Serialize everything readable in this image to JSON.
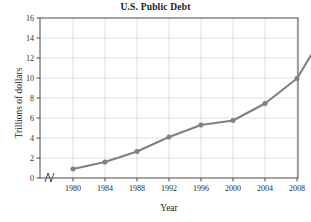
{
  "chart_data": {
    "type": "line",
    "title": "U.S. Public Debt",
    "xlabel": "Year",
    "ylabel": "Trillions of dollars",
    "x": [
      1980,
      1984,
      1988,
      1992,
      1996,
      2000,
      2004,
      2008,
      2012
    ],
    "values": [
      0.9,
      1.6,
      2.65,
      4.1,
      5.3,
      5.75,
      7.45,
      9.95,
      15.25
    ],
    "xtick_labels": [
      "1980",
      "1984",
      "1988",
      "1992",
      "1996",
      "2000",
      "2004",
      "2008",
      "2012"
    ],
    "ytick_labels": [
      "0",
      "2",
      "4",
      "6",
      "8",
      "10",
      "12",
      "14",
      "16"
    ],
    "yticks": [
      0,
      2,
      4,
      6,
      8,
      10,
      12,
      14,
      16
    ],
    "ylim": [
      0,
      16
    ],
    "xlim": [
      1978,
      2016
    ],
    "grid": true,
    "legend": null,
    "axis_break": true,
    "series_color": "#808080",
    "grid_color": "#d8d8dc",
    "frame_color": "#4a4a4a",
    "marker": "circle"
  }
}
